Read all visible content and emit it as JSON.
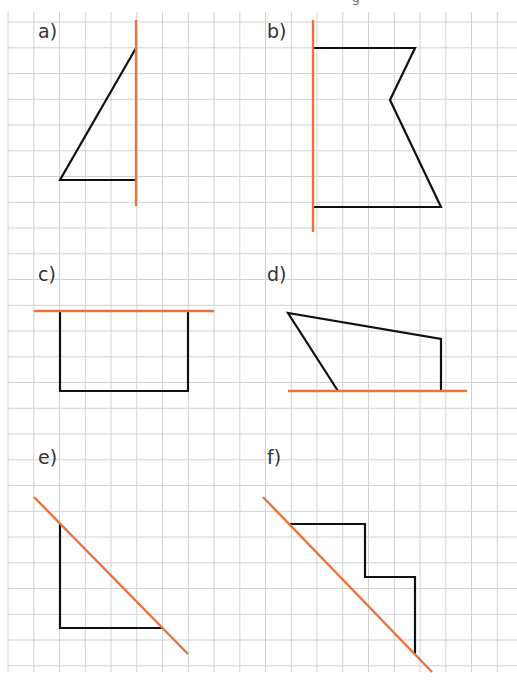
{
  "worksheet": {
    "top_clipped_glyph": "g",
    "grid": {
      "origin_x": 8,
      "origin_y": 22,
      "pitch": 25.75,
      "cols": 20,
      "rows": 26,
      "top": 12,
      "bottom": 672,
      "left": 8,
      "right": 517,
      "color": "#d2d2d2"
    },
    "colors": {
      "axis": "#e8743b",
      "shape": "#111111",
      "label": "#333333"
    },
    "exercises": [
      {
        "id": "a",
        "label": "a)",
        "label_pos": [
          38,
          22
        ],
        "axis": [
          [
            136,
            20
          ],
          [
            136,
            206
          ]
        ],
        "shape": [
          [
            136,
            48
          ],
          [
            60,
            180
          ],
          [
            136,
            180
          ]
        ],
        "closed": false
      },
      {
        "id": "b",
        "label": "b)",
        "label_pos": [
          267,
          22
        ],
        "axis": [
          [
            313,
            20
          ],
          [
            313,
            232
          ]
        ],
        "shape": [
          [
            313,
            48
          ],
          [
            415,
            48
          ],
          [
            390,
            100
          ],
          [
            441,
            207
          ],
          [
            313,
            207
          ]
        ],
        "closed": false
      },
      {
        "id": "c",
        "label": "c)",
        "label_pos": [
          38,
          265
        ],
        "axis": [
          [
            34,
            311
          ],
          [
            214,
            311
          ]
        ],
        "shape": [
          [
            60,
            311
          ],
          [
            60,
            391
          ],
          [
            188,
            391
          ],
          [
            188,
            311
          ]
        ],
        "closed": false
      },
      {
        "id": "d",
        "label": "d)",
        "label_pos": [
          267,
          265
        ],
        "axis": [
          [
            288,
            391
          ],
          [
            467,
            391
          ]
        ],
        "shape": [
          [
            338,
            391
          ],
          [
            288,
            313
          ],
          [
            441,
            339
          ],
          [
            441,
            391
          ]
        ],
        "closed": false
      },
      {
        "id": "e",
        "label": "e)",
        "label_pos": [
          38,
          448
        ],
        "axis": [
          [
            34,
            497
          ],
          [
            188,
            654
          ]
        ],
        "shape": [
          [
            60,
            524
          ],
          [
            60,
            628
          ],
          [
            162,
            628
          ]
        ],
        "closed": false
      },
      {
        "id": "f",
        "label": "f)",
        "label_pos": [
          267,
          448
        ],
        "axis": [
          [
            263,
            497
          ],
          [
            432,
            672
          ]
        ],
        "shape": [
          [
            290,
            524
          ],
          [
            365,
            524
          ],
          [
            365,
            577
          ],
          [
            415,
            577
          ],
          [
            415,
            655
          ]
        ],
        "closed": false
      }
    ]
  }
}
